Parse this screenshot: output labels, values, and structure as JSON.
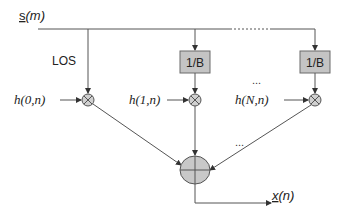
{
  "diagram": {
    "input_label": {
      "base": "s",
      "arg": "(m)"
    },
    "output_label": {
      "base": "x",
      "arg": "(n)"
    },
    "los_label": "LOS",
    "branches": [
      {
        "gain_label": null,
        "coef_label": "h(0,n)"
      },
      {
        "gain_label": "1/B",
        "coef_label": "h(1,n)"
      },
      {
        "gain_label": "1/B",
        "coef_label": "h(N,n)"
      }
    ],
    "ellipsis_top": "...",
    "ellipsis_mid": "...",
    "ellipsis_low": "...",
    "colors": {
      "line": "#555555",
      "box_fill": "#c4c4c4",
      "box_stroke": "#6a6a6a",
      "node_fill": "#c8c8c8",
      "text": "#222222"
    }
  }
}
